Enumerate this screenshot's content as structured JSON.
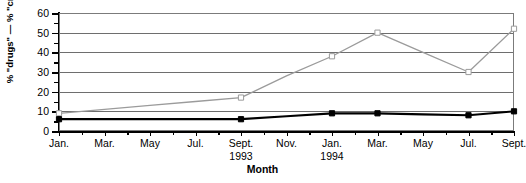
{
  "chart_data": {
    "type": "line",
    "title": "",
    "xlabel": "Month",
    "ylabel": "% \"drugs\" — % \"crime\"",
    "categories": [
      "Jan. 1993",
      "Mar. 1993",
      "May 1993",
      "Jul. 1993",
      "Sept. 1993",
      "Nov. 1993",
      "Jan. 1994",
      "Mar. 1994",
      "May 1994",
      "Jul. 1994",
      "Sept. 1994"
    ],
    "x": [
      0,
      1,
      2,
      3,
      4,
      5,
      6,
      7,
      8,
      9,
      10
    ],
    "ylim": [
      0,
      60
    ],
    "xlim": [
      0,
      10
    ],
    "grid": true,
    "legend": "none",
    "y_major_ticks": [
      0,
      10,
      20,
      30,
      40,
      50,
      60
    ],
    "y_minor_ticks": [
      5,
      15,
      25,
      35,
      45,
      55
    ],
    "series": [
      {
        "name": "drugs",
        "color": "#9b9b9b",
        "marker": "square-open",
        "values": [
          9,
          11,
          13,
          15,
          17,
          28,
          38,
          50,
          40,
          30,
          52
        ],
        "marker_points": [
          {
            "x": 0,
            "y": 9
          },
          {
            "x": 4,
            "y": 17
          },
          {
            "x": 6,
            "y": 38
          },
          {
            "x": 7,
            "y": 50
          },
          {
            "x": 9,
            "y": 30
          },
          {
            "x": 10,
            "y": 52
          }
        ]
      },
      {
        "name": "crime",
        "color": "#000000",
        "marker": "square-filled",
        "values": [
          6,
          6,
          6,
          6,
          6,
          7.5,
          9,
          9,
          8.5,
          8,
          10
        ],
        "marker_points": [
          {
            "x": 0,
            "y": 6
          },
          {
            "x": 4,
            "y": 6
          },
          {
            "x": 6,
            "y": 9
          },
          {
            "x": 7,
            "y": 9
          },
          {
            "x": 9,
            "y": 8
          },
          {
            "x": 10,
            "y": 10
          }
        ]
      }
    ]
  },
  "axes": {
    "y_labels": [
      "0",
      "10",
      "20",
      "30",
      "40",
      "50",
      "60"
    ],
    "x_labels": [
      {
        "label": "Jan.",
        "year": "",
        "index": 0
      },
      {
        "label": "Mar.",
        "year": "",
        "index": 1
      },
      {
        "label": "May",
        "year": "",
        "index": 2
      },
      {
        "label": "Jul.",
        "year": "",
        "index": 3
      },
      {
        "label": "Sept.",
        "year": "1993",
        "index": 4
      },
      {
        "label": "Nov.",
        "year": "",
        "index": 5
      },
      {
        "label": "Jan.",
        "year": "1994",
        "index": 6
      },
      {
        "label": "Mar.",
        "year": "",
        "index": 7
      },
      {
        "label": "May",
        "year": "",
        "index": 8
      },
      {
        "label": "Jul.",
        "year": "",
        "index": 9
      },
      {
        "label": "Sept.",
        "year": "",
        "index": 10
      }
    ],
    "x_title": "Month",
    "y_title": "% \"drugs\" — % \"crime\""
  }
}
